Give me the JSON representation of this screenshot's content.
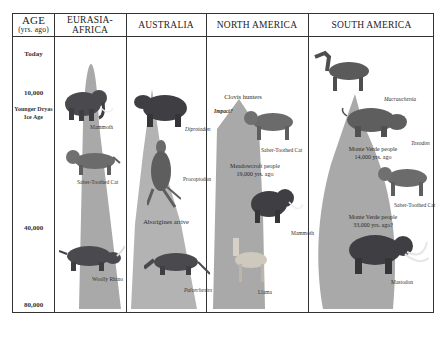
{
  "header": {
    "age_title": "AGE",
    "age_subtitle": "(yrs. ago)",
    "columns": [
      "EURASIA-AFRICA",
      "AUSTRALIA",
      "NORTH AMERICA",
      "SOUTH AMERICA"
    ]
  },
  "axis": {
    "ticks": [
      "Today",
      "10,000",
      "Younger Dryas Ice Age",
      "40,000",
      "80,000"
    ]
  },
  "eurasia": {
    "animals": [
      "Mammoth",
      "Saber-Toothed Cat",
      "Woolly Rhino"
    ]
  },
  "australia": {
    "animals": [
      "Diprotodon",
      "Procoptodon",
      "Palorchestes"
    ],
    "events": [
      "Aborigines arrive"
    ]
  },
  "north_america": {
    "animals": [
      "Saber-Toothed Cat",
      "Mammoth",
      "Llama"
    ],
    "events": [
      "Clovis hunters",
      "Impact?",
      "Meadowcroft people",
      "19,000 yrs. ago"
    ]
  },
  "south_america": {
    "animals": [
      "Macrauchenia",
      "Toxodon",
      "Saber-Toothed Cat",
      "Mastodon"
    ],
    "events": [
      "Monte Verde people",
      "14,000 yrs. ago",
      "Monte Verde people",
      "33,000 yrs. ago?"
    ]
  },
  "colors": {
    "shape_fill": "#a9a9a9",
    "border": "#333333",
    "animal_dark": "#4a4a4e"
  }
}
